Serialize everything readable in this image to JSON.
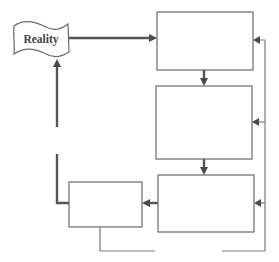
{
  "diagram": {
    "type": "flowchart",
    "nodes": [
      {
        "id": "reality",
        "shape": "flag",
        "label": "Reality"
      },
      {
        "id": "box1",
        "shape": "rectangle",
        "label": ""
      },
      {
        "id": "box2",
        "shape": "rectangle",
        "label": ""
      },
      {
        "id": "box3",
        "shape": "rectangle",
        "label": ""
      },
      {
        "id": "box4",
        "shape": "rectangle",
        "label": ""
      }
    ],
    "edges": [
      {
        "from": "reality",
        "to": "box1",
        "style": "thick"
      },
      {
        "from": "box1",
        "to": "box2",
        "style": "thick"
      },
      {
        "from": "box2",
        "to": "box3",
        "style": "thick"
      },
      {
        "from": "box3",
        "to": "box4",
        "style": "thick"
      },
      {
        "from": "box4",
        "to": "reality",
        "style": "thick",
        "note": "broken line with gap"
      },
      {
        "from": "box4",
        "to": "box1",
        "style": "thin",
        "note": "feedback loop via bottom and right side, broken"
      },
      {
        "from": "feedback",
        "to": "box2",
        "style": "thin"
      },
      {
        "from": "feedback",
        "to": "box3",
        "style": "thin"
      }
    ],
    "colors": {
      "stroke": "#6a6a6a",
      "thick_stroke": "#555555",
      "text": "#444444",
      "background": "#ffffff"
    }
  }
}
